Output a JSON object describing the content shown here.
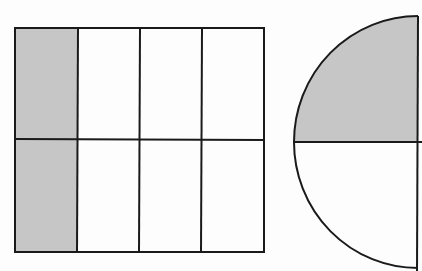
{
  "figure": {
    "colors": {
      "background": "#fdfdfd",
      "stroke": "#1a1a1a",
      "shade": "#c6c6c6"
    },
    "rectangle": {
      "columns": 4,
      "rows": 2,
      "total_parts": 8,
      "shaded_parts": 2,
      "shaded_column": 1
    },
    "semicircle": {
      "total_parts": 2,
      "shaded_parts": 1,
      "shaded_region": "upper quarter"
    }
  }
}
